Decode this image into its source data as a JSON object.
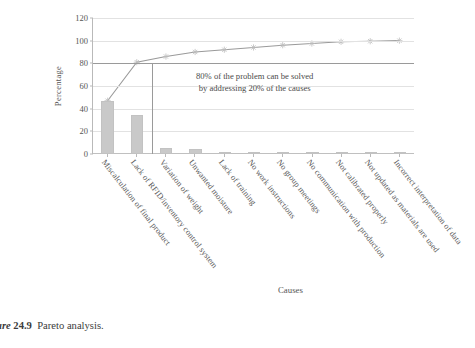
{
  "caption": {
    "prefix": "ure",
    "number": "24.9",
    "text": "Pareto analysis."
  },
  "chart_data": {
    "type": "bar",
    "title": "",
    "xlabel": "Causes",
    "ylabel": "Percentage",
    "ylim": [
      0,
      120
    ],
    "yticks": [
      0,
      20,
      40,
      60,
      80,
      100,
      120
    ],
    "grid": true,
    "legend": "none",
    "categories": [
      "Miscalculation of final product",
      "Lack of RFID/inventory control system",
      "Variation of weight",
      "Unwanted moisture",
      "Lack of training",
      "No work instructions",
      "No group meetings",
      "No communication with production",
      "Not calibrated properly",
      "Not updated as materials are used",
      "Incorrect interpretation of data"
    ],
    "values": [
      47,
      34,
      5,
      4,
      2,
      2,
      2,
      1.5,
      1.5,
      1,
      1
    ],
    "series": [
      {
        "name": "Cumulative percentage",
        "type": "line",
        "marker": "star",
        "values": [
          47,
          81,
          86,
          90,
          92,
          94,
          96,
          97.5,
          99,
          99.5,
          100
        ]
      }
    ],
    "reference_lines": [
      {
        "name": "80-percent-line",
        "orientation": "horizontal",
        "value": 80
      },
      {
        "name": "20-percent-causes-line",
        "orientation": "vertical",
        "at_category_index": 2
      }
    ],
    "annotation": {
      "line1": "80% of the problem can be solved",
      "line2": "by addressing 20% of the causes"
    }
  },
  "colors": {
    "bar": "#c9c9c9",
    "line": "#9a9a9a",
    "grid": "#e2e2e2",
    "text": "#4a4a4a"
  }
}
